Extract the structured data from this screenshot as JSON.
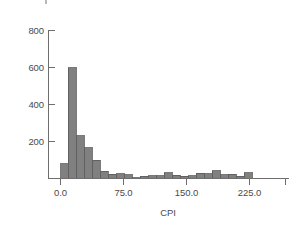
{
  "chart_data": {
    "type": "bar",
    "title": "",
    "subtitle": "",
    "xlabel": "CPI",
    "ylabel": "",
    "grid": false,
    "legend": null,
    "xlim": [
      -10.0,
      265.0
    ],
    "ylim": [
      0,
      860
    ],
    "xticks": [
      0.0,
      75.0,
      150.0,
      225.0
    ],
    "xtick_labels": [
      "0.0",
      "75.0",
      "150.0",
      "225.0"
    ],
    "yticks": [
      200,
      400,
      600,
      800
    ],
    "ytick_labels": [
      "200",
      "400",
      "600",
      "800"
    ],
    "bin_width": 9.5,
    "bar_color": "#808080",
    "bar_edge_color": "#595959",
    "axis_color": "#6e6e6e",
    "text_color": "#4a4a4a",
    "background_color": "#ffffff",
    "categories": [
      "0.0",
      "9.5",
      "19.0",
      "28.5",
      "38.0",
      "47.5",
      "57.0",
      "66.5",
      "76.0",
      "85.5",
      "95.0",
      "104.5",
      "114.0",
      "123.5",
      "133.0",
      "142.5",
      "152.0",
      "161.5",
      "171.0",
      "180.5",
      "190.0",
      "199.5",
      "209.0",
      "218.5",
      "228.0"
    ],
    "values": [
      80,
      600,
      230,
      165,
      100,
      40,
      22,
      25,
      20,
      5,
      12,
      14,
      16,
      32,
      18,
      12,
      14,
      28,
      26,
      42,
      20,
      22,
      12,
      30,
      0
    ],
    "annotations": []
  },
  "axes": {
    "x_axis_name": "CPI",
    "y_axis_name": ""
  }
}
